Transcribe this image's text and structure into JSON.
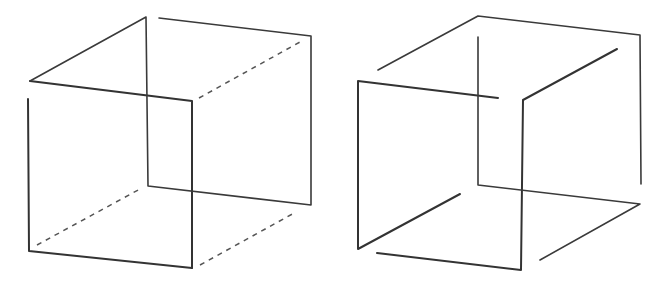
{
  "figures": [
    {
      "name": "necker-cube-ambiguous",
      "description": "Wireframe cube with hidden edges dashed",
      "solid_edges": [
        {
          "role": "front",
          "points": [
            [
              30,
              81
            ],
            [
              192,
              101
            ],
            [
              192,
              268
            ]
          ]
        },
        {
          "role": "front",
          "points": [
            [
              28,
              99
            ],
            [
              29,
              251
            ],
            [
              192,
              268
            ]
          ]
        },
        {
          "role": "back",
          "points": [
            [
              30,
              81
            ],
            [
              146,
              17
            ],
            [
              148,
              186
            ],
            [
              311,
              205
            ],
            [
              311,
              36
            ],
            [
              159,
              18
            ]
          ]
        }
      ],
      "dashed_edges": [
        {
          "points": [
            [
              199,
              98
            ],
            [
              300,
              42
            ]
          ]
        },
        {
          "points": [
            [
              37,
              245
            ],
            [
              140,
              189
            ]
          ]
        },
        {
          "points": [
            [
              200,
              265
            ],
            [
              296,
              212
            ]
          ]
        }
      ]
    },
    {
      "name": "impossible-cube",
      "description": "Wireframe cube with broken edges implying impossible figure",
      "solid_edges": [
        {
          "role": "front",
          "points": [
            [
              498,
              98
            ],
            [
              358,
              81
            ],
            [
              358,
              249
            ],
            [
              460,
              194
            ]
          ]
        },
        {
          "role": "front",
          "points": [
            [
              377,
              253
            ],
            [
              521,
              270
            ],
            [
              523,
              100
            ],
            [
              617,
              49
            ]
          ]
        },
        {
          "role": "back",
          "points": [
            [
              378,
              70
            ],
            [
              478,
              16
            ],
            [
              640,
              35
            ],
            [
              641,
              184
            ]
          ]
        },
        {
          "role": "back",
          "points": [
            [
              478,
              37
            ],
            [
              478,
              185
            ],
            [
              640,
              204
            ],
            [
              540,
              260
            ]
          ]
        }
      ],
      "dashed_edges": []
    }
  ],
  "colors": {
    "background": "#ffffff",
    "line": "#333333"
  }
}
